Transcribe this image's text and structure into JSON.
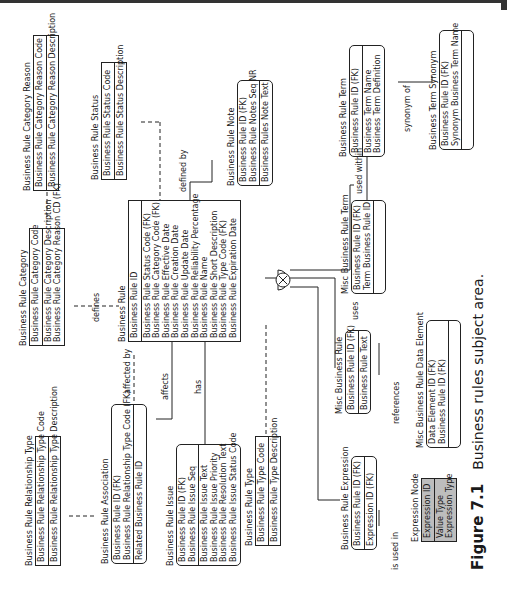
{
  "figure": {
    "number": "Figure 7.1",
    "caption": "Business rules subject area."
  },
  "entities": {
    "category_reason": {
      "title": "Business Rule Category Reason",
      "sections": [
        [
          "Business Rule Category Reason Code"
        ],
        [
          "Business Rule Category Reason Description"
        ]
      ]
    },
    "status": {
      "title": "Business Rule Status",
      "sections": [
        [
          "Business Rule Status Code"
        ],
        [
          "Business Rule Status Description"
        ]
      ]
    },
    "category": {
      "title": "Business Rule Category",
      "sections": [
        [
          "Business Rule Category Code"
        ],
        [
          "Business Rule Category Description",
          "Business Rule Category Reason CD (FK)"
        ]
      ]
    },
    "business_rule": {
      "title": "Business Rule",
      "sections": [
        [
          "Business Rule ID"
        ],
        [
          "Business Rule Status Code (FK)",
          "Business Rule Category Code (FK)",
          "Business Rule Effective Date",
          "Business Rule Creation Date",
          "Business Rule Update Date",
          "Business Rule Reliability Percentage",
          "Business Rule Name",
          "Business Rule Short Description",
          "Business Rule Type Code (FK)",
          "Business Rule Expiration Date"
        ]
      ]
    },
    "note": {
      "title": "Business Rule Note",
      "sections": [
        [
          "Business Rule ID (FK)",
          "Business Rule Notes Seq NR"
        ],
        [
          "Business Rules Note Text"
        ]
      ]
    },
    "term": {
      "title": "Business Rule Term",
      "sections": [
        [
          "Business Rule ID (FK)"
        ],
        [
          "Business Term Name",
          "Business Term Definition"
        ]
      ]
    },
    "term_synonym": {
      "title": "Business Term Synonym",
      "sections": [
        [
          "Business Rule ID (FK)",
          "Synonym Business Term Name"
        ],
        []
      ]
    },
    "misc_rule_term": {
      "title": "Misc Business Rule Term",
      "sections": [
        [
          "Business Rule ID (FK)",
          "Term Business Rule ID"
        ],
        []
      ]
    },
    "misc_rule": {
      "title": "Misc Business Rule",
      "sections": [
        [
          "Business Rule ID (FK)"
        ],
        [
          "Business Rule Text"
        ]
      ]
    },
    "misc_data_element": {
      "title": "Misc Business Rule Data Element",
      "sections": [
        [
          "Data Element ID (FK)",
          "Business Rule ID (FK)"
        ],
        []
      ]
    },
    "relationship_type": {
      "title": "Business Rule Relationship Type",
      "sections": [
        [
          "Business Rule Relationship Type Code"
        ],
        [
          "Business Rule Relationship Type Description"
        ]
      ]
    },
    "association": {
      "title": "Business Rule Association",
      "sections": [
        [
          "Business Rule ID (FK)",
          "Business Rule Relationship Type Code (FK)"
        ],
        [
          "Related Business Rule ID"
        ]
      ]
    },
    "issue": {
      "title": "Business Rule Issue",
      "sections": [
        [
          "Business Rule ID (FK)",
          "Business Rule Issue Seq"
        ],
        [
          "Business Rule Issue Text",
          "Business Rule Issue Priority",
          "Business Rule Resolution Text",
          "Business Rule Issue Status Code"
        ]
      ]
    },
    "type": {
      "title": "Business Rule Type",
      "sections": [
        [
          "Business Rule Type Code"
        ],
        [
          "Business Rule Type Description"
        ]
      ]
    },
    "expression": {
      "title": "Business Rule Expression",
      "sections": [
        [
          "Business Rule ID (FK)"
        ],
        [
          "Expression ID (FK)"
        ]
      ]
    },
    "expression_node": {
      "title": "Expression Node",
      "sections": [
        [
          "Expression ID"
        ],
        [
          "Value Type",
          "Expression Type"
        ]
      ]
    }
  },
  "relationships": {
    "defines": "defines",
    "defined_by": "defined by",
    "synonym_of": "synonym of",
    "used_within": "used within",
    "uses": "uses",
    "references": "references",
    "affected_by": "affected by",
    "affects": "affects",
    "has": "has",
    "is_used_in": "is used in"
  }
}
